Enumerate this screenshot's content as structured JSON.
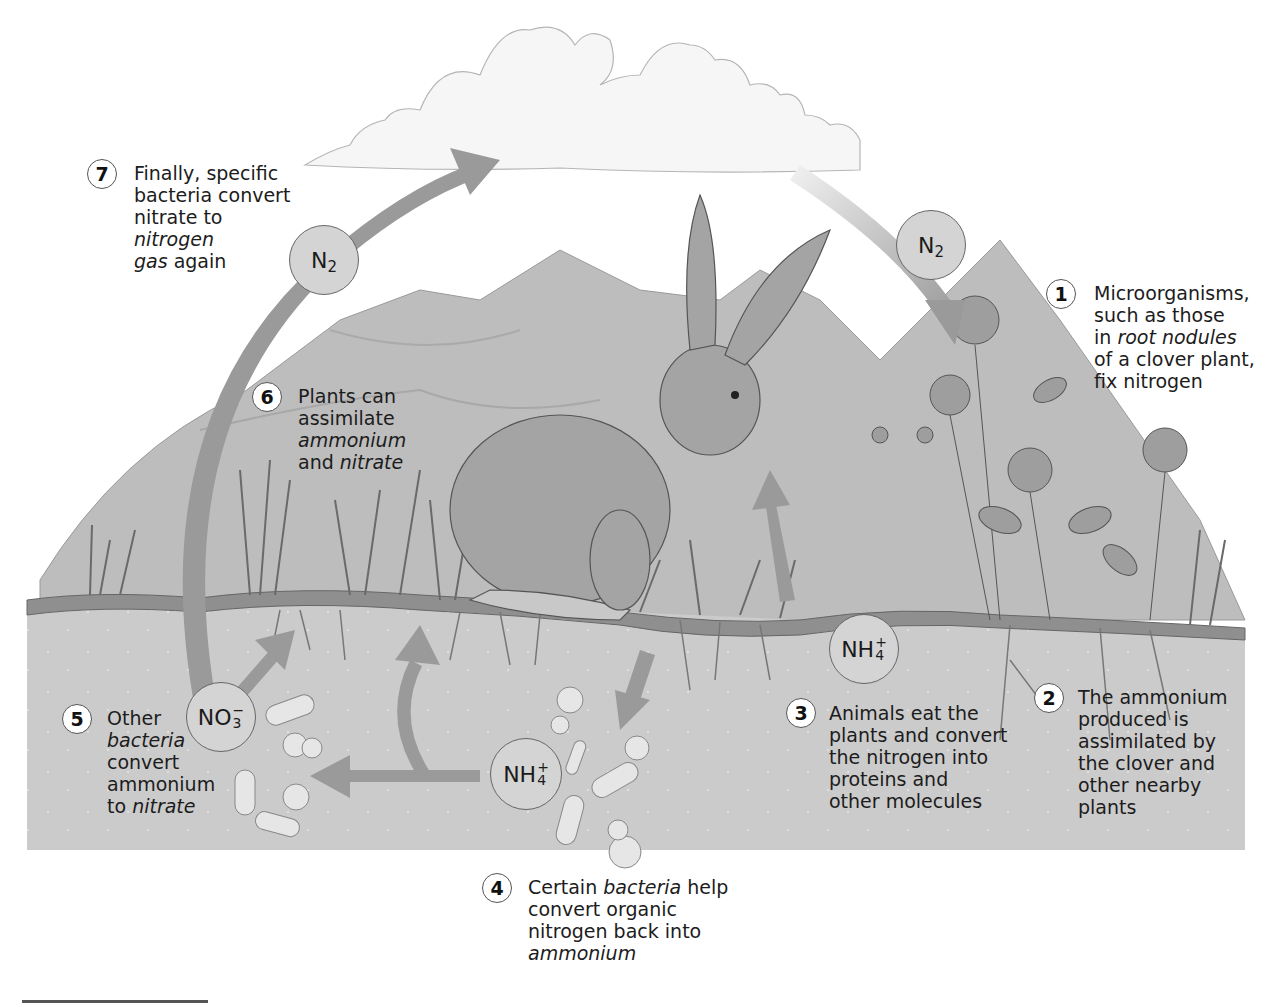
{
  "diagram": {
    "type": "nitrogen-cycle",
    "steps": [
      {
        "number": "1",
        "lines": [
          "Microorganisms,",
          "such as those",
          "in |root nodules|",
          "of a clover plant,",
          "fix nitrogen"
        ]
      },
      {
        "number": "2",
        "lines": [
          "The ammonium",
          "produced is",
          "assimilated by",
          "the clover and",
          "other nearby",
          "plants"
        ]
      },
      {
        "number": "3",
        "lines": [
          "Animals eat the",
          "plants and convert",
          "the nitrogen into",
          "proteins and",
          "other molecules"
        ]
      },
      {
        "number": "4",
        "lines": [
          "Certain |bacteria| help",
          "convert organic",
          "nitrogen back into",
          "|ammonium|"
        ]
      },
      {
        "number": "5",
        "lines": [
          "Other",
          "|bacteria|",
          "convert",
          "ammonium",
          "to |nitrate|"
        ]
      },
      {
        "number": "6",
        "lines": [
          "Plants can",
          "assimilate",
          "|ammonium|",
          "and |nitrate|"
        ]
      },
      {
        "number": "7",
        "lines": [
          "Finally, specific",
          "bacteria convert",
          "nitrate to",
          "|nitrogen|",
          "|gas| again"
        ]
      }
    ],
    "chemicals": [
      {
        "id": "n2-left",
        "base": "N",
        "sub": "2",
        "sup": ""
      },
      {
        "id": "n2-right",
        "base": "N",
        "sub": "2",
        "sup": ""
      },
      {
        "id": "nh4-right",
        "base": "NH",
        "sub": "4",
        "sup": "+"
      },
      {
        "id": "nh4-center",
        "base": "NH",
        "sub": "4",
        "sup": "+"
      },
      {
        "id": "no3-left",
        "base": "NO",
        "sub": "3",
        "sup": "−"
      }
    ],
    "illustration": {
      "elements": [
        "cloud",
        "mountains",
        "hare",
        "clover-plants",
        "grass",
        "soil",
        "roots",
        "bacteria"
      ]
    },
    "colors": {
      "arrow": "#9a9a9a",
      "soil": "#c8c8c8",
      "ground_strip": "#8f8f8f",
      "mountain": "#bdbdbd",
      "chem_fill": "#d4d4d4"
    }
  }
}
